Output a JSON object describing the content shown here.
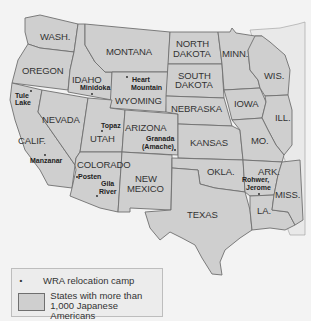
{
  "map": {
    "title": "",
    "colors": {
      "state_fill": "#cfcfcf",
      "border": "#6f6f6f",
      "background": "#f3f3f3",
      "text": "#333333"
    },
    "states": [
      {
        "id": "wa",
        "label": "WASH."
      },
      {
        "id": "or",
        "label": "OREGON"
      },
      {
        "id": "ca",
        "label": "CALIF."
      },
      {
        "id": "id",
        "label": "IDAHO"
      },
      {
        "id": "nv",
        "label": "NEVADA"
      },
      {
        "id": "mt",
        "label": "MONTANA"
      },
      {
        "id": "wy",
        "label": "WYOMING"
      },
      {
        "id": "ut",
        "label": "UTAH"
      },
      {
        "id": "az",
        "label": "ARIZONA"
      },
      {
        "id": "co",
        "label": "COLORADO"
      },
      {
        "id": "nm_line1",
        "label": "NEW"
      },
      {
        "id": "nm_line2",
        "label": "MEXICO"
      },
      {
        "id": "nd_line1",
        "label": "NORTH"
      },
      {
        "id": "nd_line2",
        "label": "DAKOTA"
      },
      {
        "id": "sd_line1",
        "label": "SOUTH"
      },
      {
        "id": "sd_line2",
        "label": "DAKOTA"
      },
      {
        "id": "ne",
        "label": "NEBRASKA"
      },
      {
        "id": "ks",
        "label": "KANSAS"
      },
      {
        "id": "ok",
        "label": "OKLA."
      },
      {
        "id": "tx",
        "label": "TEXAS"
      },
      {
        "id": "mn",
        "label": "MINN."
      },
      {
        "id": "ia",
        "label": "IOWA"
      },
      {
        "id": "mo",
        "label": "MO."
      },
      {
        "id": "ar",
        "label": "ARK."
      },
      {
        "id": "la",
        "label": "LA."
      },
      {
        "id": "wi",
        "label": "WIS."
      },
      {
        "id": "il",
        "label": "ILL."
      },
      {
        "id": "ms",
        "label": "MISS."
      }
    ],
    "camps": [
      {
        "id": "tule_lake",
        "lines": [
          "Tule",
          "Lake"
        ]
      },
      {
        "id": "minidoka",
        "lines": [
          "Minidoka"
        ]
      },
      {
        "id": "heart_mountain",
        "lines": [
          "Heart",
          "Mountain"
        ]
      },
      {
        "id": "manzanar",
        "lines": [
          "Manzanar"
        ]
      },
      {
        "id": "topaz",
        "lines": [
          "Topaz"
        ]
      },
      {
        "id": "granada",
        "lines": [
          "Granada",
          "(Amache)"
        ]
      },
      {
        "id": "poston",
        "lines": [
          "Posten"
        ]
      },
      {
        "id": "gila_river",
        "lines": [
          "Gila",
          "River"
        ]
      },
      {
        "id": "rohwer_jerome",
        "lines": [
          "Rohwer,",
          "Jerome"
        ]
      }
    ]
  },
  "legend": {
    "camp_symbol": "•",
    "camp_label": "WRA relocation camp",
    "states_label_line1": "States with more than",
    "states_label_line2": "1,000 Japanese Americans"
  }
}
